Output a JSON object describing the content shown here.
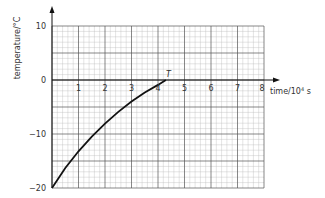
{
  "chart_data": {
    "type": "line",
    "title": "",
    "xlabel": "time/10⁴ s",
    "ylabel": "temperature/°C",
    "xlim": [
      0,
      8
    ],
    "ylim": [
      -20,
      10
    ],
    "x_ticks": [
      "1",
      "2",
      "3",
      "4",
      "5",
      "6",
      "7",
      "8"
    ],
    "y_ticks": [
      "10",
      "0",
      "−10",
      "−20"
    ],
    "grid": true,
    "series": [
      {
        "name": "temperature",
        "x": [
          0,
          0.5,
          1,
          1.5,
          2,
          2.5,
          3,
          3.5,
          4,
          4.3
        ],
        "values": [
          -20,
          -16.3,
          -13.2,
          -10.5,
          -8.1,
          -5.9,
          -4.0,
          -2.3,
          -0.9,
          0
        ]
      }
    ],
    "annotations": [
      {
        "text": "T",
        "x": 4.3,
        "y": 0
      }
    ]
  },
  "labels": {
    "ylabel": "temperature/°C",
    "xlabel_main": "time/10",
    "xlabel_sup": "4",
    "xlabel_unit": " s",
    "point_label": "T",
    "y10": "10",
    "y0": "0",
    "ym10": "−10",
    "ym20": "−20",
    "x1": "1",
    "x2": "2",
    "x3": "3",
    "x4": "4",
    "x5": "5",
    "x6": "6",
    "x7": "7",
    "x8": "8"
  }
}
